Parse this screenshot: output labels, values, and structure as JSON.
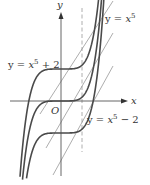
{
  "figure": {
    "axes": {
      "x_label": "x",
      "y_label": "y",
      "origin_label": "O"
    },
    "curves": [
      {
        "name": "upper",
        "equation_prefix": "y = ",
        "var": "x",
        "exp": "5",
        "suffix": " + 2",
        "shift": 2
      },
      {
        "name": "middle",
        "equation_prefix": "y = ",
        "var": "x",
        "exp": "5",
        "suffix": "",
        "shift": 0
      },
      {
        "name": "lower",
        "equation_prefix": "y = ",
        "var": "x",
        "exp": "5",
        "suffix": " − 2",
        "shift": -2
      }
    ],
    "tangent_lines": 3,
    "dashed_vertical_line": true,
    "colors": {
      "curve": "#4a4a4a",
      "axis": "#555555",
      "tangent": "#8a8a8a",
      "dashed": "#9a9a9a"
    }
  }
}
